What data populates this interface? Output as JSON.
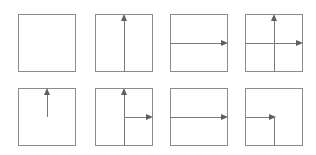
{
  "figure": {
    "title": "",
    "type": "axis-arrow-panel-grid",
    "canvas": {
      "width": 316,
      "height": 155,
      "background": "#ffffff"
    },
    "grid": {
      "rows": 2,
      "columns": 4
    },
    "style": {
      "frame_color": "#8d8d8d",
      "line_color": "#7a7a7a",
      "arrowhead_color": "#5f5f5f",
      "frame_fill": "#ffffff",
      "line_width": 1
    },
    "panel_geometry": {
      "size": 58,
      "column_x": [
        18,
        95,
        170,
        245
      ],
      "row_y": [
        14,
        88
      ]
    },
    "panels": [
      {
        "index": 1,
        "label": "",
        "row": 1,
        "column": 1,
        "description": "empty square frame",
        "vertical": "none",
        "horizontal": "none",
        "arrows": []
      },
      {
        "index": 2,
        "label": "",
        "row": 1,
        "column": 2,
        "description": "full vertical line with up arrow",
        "vertical": "full",
        "horizontal": "none",
        "arrows": [
          "up"
        ]
      },
      {
        "index": 3,
        "label": "",
        "row": 1,
        "column": 3,
        "description": "full horizontal line with right arrow",
        "vertical": "none",
        "horizontal": "full",
        "arrows": [
          "right"
        ]
      },
      {
        "index": 4,
        "label": "",
        "row": 1,
        "column": 4,
        "description": "full cross, up arrow and right arrow",
        "vertical": "full",
        "horizontal": "full",
        "arrows": [
          "up",
          "right"
        ]
      },
      {
        "index": 5,
        "label": "",
        "row": 2,
        "column": 1,
        "description": "vertical half line from center upward with up arrow",
        "vertical": "upper-half",
        "horizontal": "none",
        "arrows": [
          "up"
        ]
      },
      {
        "index": 6,
        "label": "",
        "row": 2,
        "column": 2,
        "description": "full vertical line with up arrow plus right half horizontal with right arrow",
        "vertical": "full",
        "horizontal": "right-half",
        "arrows": [
          "up",
          "right"
        ]
      },
      {
        "index": 7,
        "label": "",
        "row": 2,
        "column": 3,
        "description": "full horizontal line with right arrow",
        "vertical": "none",
        "horizontal": "full",
        "arrows": [
          "right"
        ]
      },
      {
        "index": 8,
        "label": "",
        "row": 2,
        "column": 4,
        "description": "left half horizontal with right arrow ending at center plus vertical half line from center downward",
        "vertical": "lower-half",
        "horizontal": "left-half",
        "arrows": [
          "right"
        ]
      }
    ]
  },
  "chart_data": {
    "type": "diagram",
    "title": "",
    "subtitle": "",
    "xlabel": "",
    "ylabel": "",
    "legend": [],
    "annotations": [],
    "grid": false,
    "series": [
      {
        "name": "panel-1",
        "vertical": "none",
        "horizontal": "none",
        "arrows": []
      },
      {
        "name": "panel-2",
        "vertical": "full",
        "horizontal": "none",
        "arrows": [
          "up"
        ]
      },
      {
        "name": "panel-3",
        "vertical": "none",
        "horizontal": "full",
        "arrows": [
          "right"
        ]
      },
      {
        "name": "panel-4",
        "vertical": "full",
        "horizontal": "full",
        "arrows": [
          "up",
          "right"
        ]
      },
      {
        "name": "panel-5",
        "vertical": "upper-half",
        "horizontal": "none",
        "arrows": [
          "up"
        ]
      },
      {
        "name": "panel-6",
        "vertical": "full",
        "horizontal": "right-half",
        "arrows": [
          "up",
          "right"
        ]
      },
      {
        "name": "panel-7",
        "vertical": "none",
        "horizontal": "full",
        "arrows": [
          "right"
        ]
      },
      {
        "name": "panel-8",
        "vertical": "lower-half",
        "horizontal": "left-half",
        "arrows": [
          "right"
        ]
      }
    ]
  }
}
